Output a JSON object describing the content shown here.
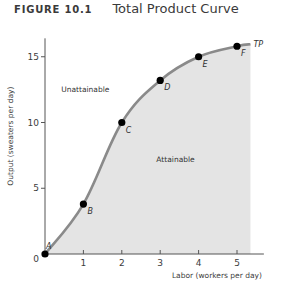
{
  "figure": {
    "number": "FIGURE 10.1",
    "title": "Total Product Curve"
  },
  "chart_data": {
    "type": "area",
    "title": "Total Product Curve",
    "xlabel": "Labor (workers per day)",
    "ylabel": "Output (sweaters per day)",
    "xlim": [
      0,
      5.7
    ],
    "ylim": [
      0,
      16.4
    ],
    "xticks": [
      1,
      2,
      3,
      4,
      5
    ],
    "yticks": [
      5,
      10,
      15
    ],
    "origin_label": "0",
    "grid": false,
    "legend": null,
    "series": [
      {
        "name": "TP",
        "curve_label": "TP",
        "points": [
          {
            "label": "A",
            "x": 0,
            "y": 0
          },
          {
            "label": "B",
            "x": 1,
            "y": 3.8
          },
          {
            "label": "C",
            "x": 2,
            "y": 10
          },
          {
            "label": "D",
            "x": 3,
            "y": 13.2
          },
          {
            "label": "E",
            "x": 4,
            "y": 15
          },
          {
            "label": "F",
            "x": 5,
            "y": 15.8
          }
        ],
        "curve_end": {
          "x": 5.35,
          "y": 15.95
        }
      }
    ],
    "annotations": [
      {
        "text": "Unattainable",
        "x": 1.05,
        "y": 12.3
      },
      {
        "text": "Attainable",
        "x": 3.4,
        "y": 7.0
      }
    ],
    "colors": {
      "curve": "#8a8a8a",
      "fill": "#e4e4e4",
      "point": "#000000",
      "axis": "#555555"
    }
  }
}
